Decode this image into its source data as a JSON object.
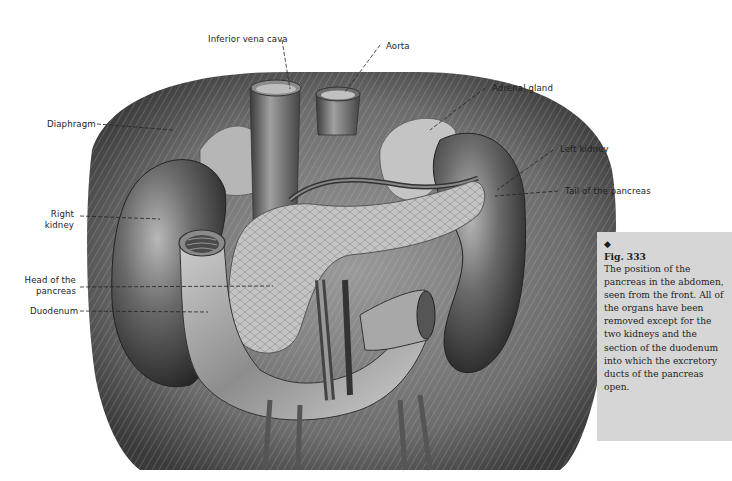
{
  "figure": {
    "labels": {
      "inferior_vena_cava": "Inferior vena cava",
      "aorta": "Aorta",
      "adrenal_gland": "Adrenal gland",
      "diaphragm": "Diaphragm",
      "left_kidney": "Left kidney",
      "tail_of_pancreas": "Tail of the pancreas",
      "right_kidney_line1": "Right",
      "right_kidney_line2": "kidney",
      "head_of_pancreas_line1": "Head of the",
      "head_of_pancreas_line2": "pancreas",
      "duodenum": "Duodenum"
    }
  },
  "caption": {
    "bullet": "◆",
    "figure_number": "Fig. 333",
    "text": "The position of the pancreas in the abdomen, seen from the front. All of the organs have been removed except for the two kidneys and the section of the duodenum into which the excretory ducts of the pancreas open.",
    "background": "#d6d6d6"
  }
}
